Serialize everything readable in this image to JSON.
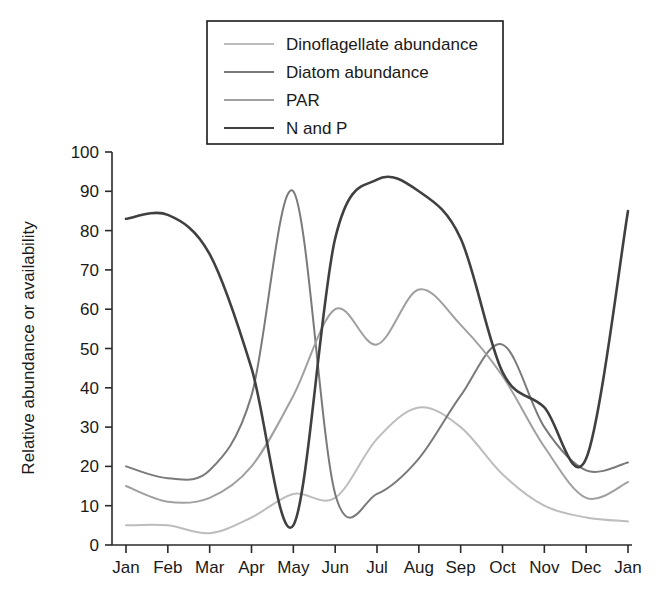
{
  "chart_data": {
    "type": "line",
    "title": "",
    "xlabel": "",
    "ylabel": "Relative abundance or availability",
    "ylim": [
      0,
      100
    ],
    "yticks": [
      0,
      10,
      20,
      30,
      40,
      50,
      60,
      70,
      80,
      90,
      100
    ],
    "categories": [
      "Jan",
      "Feb",
      "Mar",
      "Apr",
      "May",
      "Jun",
      "Jul",
      "Aug",
      "Sep",
      "Oct",
      "Nov",
      "Dec",
      "Jan"
    ],
    "grid": false,
    "legend_position": "top-center",
    "series": [
      {
        "name": "Dinoflagellate abundance",
        "color": "#bdbdbd",
        "values": [
          5,
          5,
          3,
          7,
          13,
          12,
          27,
          35,
          30,
          18,
          10,
          7,
          6
        ]
      },
      {
        "name": "Diatom abundance",
        "color": "#7a7a7a",
        "values": [
          20,
          17,
          19,
          38,
          90,
          13,
          13,
          22,
          38,
          51,
          30,
          19,
          21
        ]
      },
      {
        "name": "PAR",
        "color": "#a0a0a0",
        "values": [
          15,
          11,
          12,
          20,
          38,
          60,
          51,
          65,
          56,
          43,
          25,
          12,
          16
        ]
      },
      {
        "name": "N and P",
        "color": "#404040",
        "values": [
          83,
          84,
          74,
          45,
          5,
          78,
          93,
          90,
          78,
          44,
          35,
          22,
          85
        ]
      }
    ],
    "annotations": []
  },
  "axis": {
    "y_tick_labels": [
      "0",
      "10",
      "20",
      "30",
      "40",
      "50",
      "60",
      "70",
      "80",
      "90",
      "100"
    ],
    "x_tick_labels": [
      "Jan",
      "Feb",
      "Mar",
      "Apr",
      "May",
      "Jun",
      "Jul",
      "Aug",
      "Sep",
      "Oct",
      "Nov",
      "Dec",
      "Jan"
    ],
    "y_axis_title": "Relative abundance or availability"
  },
  "legend": {
    "entries": [
      {
        "label": "Dinoflagellate abundance",
        "color": "#bdbdbd"
      },
      {
        "label": "Diatom abundance",
        "color": "#7a7a7a"
      },
      {
        "label": "PAR",
        "color": "#a0a0a0"
      },
      {
        "label": "N and P",
        "color": "#404040"
      }
    ]
  },
  "colors": {
    "background": "#ffffff",
    "axis": "#2a2a2a",
    "text": "#1a1a1a",
    "dinoflagellate": "#bdbdbd",
    "diatom": "#7a7a7a",
    "par": "#a0a0a0",
    "nandp": "#404040"
  }
}
